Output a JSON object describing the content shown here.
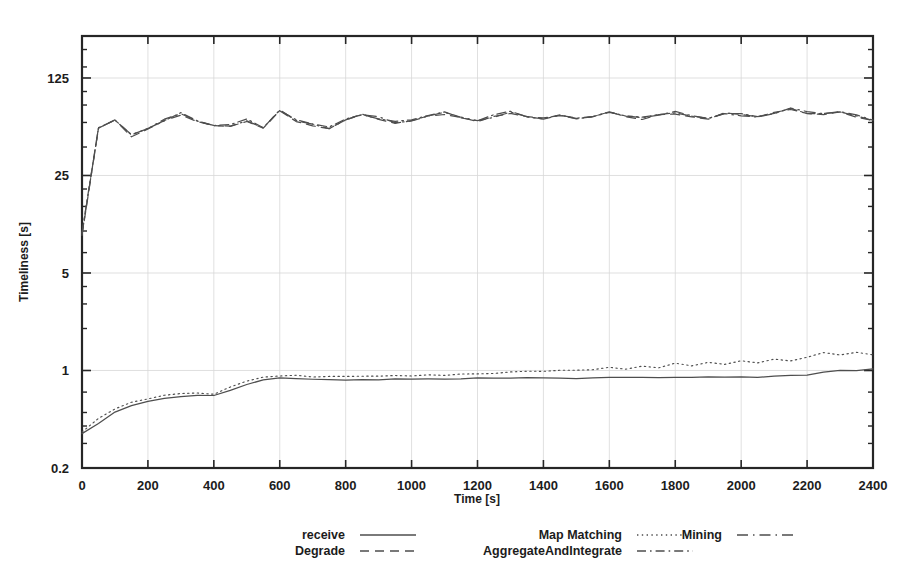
{
  "chart_data": {
    "type": "line",
    "title": "",
    "xlabel": "Time [s]",
    "ylabel": "Timeliness [s]",
    "yscale": "log",
    "xlim": [
      0,
      2400
    ],
    "ylim": [
      0.2,
      250
    ],
    "grid": true,
    "legend_position": "bottom",
    "xticks": [
      0,
      200,
      400,
      600,
      800,
      1000,
      1200,
      1400,
      1600,
      1800,
      2000,
      2200,
      2400
    ],
    "xtick_labels": [
      "0",
      "200",
      "400",
      "600",
      "800",
      "1000",
      "1200",
      "1400",
      "1600",
      "1800",
      "2000",
      "2200",
      "2400"
    ],
    "yticks": [
      0.2,
      1,
      5,
      25,
      125
    ],
    "ytick_labels": [
      "0.2",
      "1",
      "5",
      "25",
      "125"
    ],
    "x": [
      0,
      50,
      100,
      150,
      200,
      250,
      300,
      350,
      400,
      450,
      500,
      550,
      600,
      650,
      700,
      750,
      800,
      850,
      900,
      950,
      1000,
      1050,
      1100,
      1150,
      1200,
      1250,
      1300,
      1350,
      1400,
      1450,
      1500,
      1550,
      1600,
      1650,
      1700,
      1750,
      1800,
      1850,
      1900,
      1950,
      2000,
      2050,
      2100,
      2150,
      2200,
      2250,
      2300,
      2350,
      2400
    ],
    "series": [
      {
        "name": "receive",
        "style": "solid",
        "values": [
          0.35,
          0.42,
          0.5,
          0.56,
          0.6,
          0.63,
          0.65,
          0.66,
          0.66,
          0.72,
          0.8,
          0.86,
          0.88,
          0.88,
          0.87,
          0.86,
          0.86,
          0.86,
          0.86,
          0.87,
          0.87,
          0.87,
          0.87,
          0.87,
          0.88,
          0.88,
          0.88,
          0.88,
          0.88,
          0.88,
          0.88,
          0.89,
          0.89,
          0.89,
          0.89,
          0.89,
          0.9,
          0.9,
          0.9,
          0.9,
          0.9,
          0.9,
          0.91,
          0.92,
          0.93,
          0.98,
          1.0,
          1.0,
          1.02
        ]
      },
      {
        "name": "Map Matching",
        "style": "dotted",
        "values": [
          0.36,
          0.45,
          0.53,
          0.59,
          0.63,
          0.66,
          0.68,
          0.69,
          0.68,
          0.76,
          0.84,
          0.9,
          0.92,
          0.92,
          0.9,
          0.9,
          0.9,
          0.91,
          0.91,
          0.92,
          0.92,
          0.93,
          0.93,
          0.94,
          0.95,
          0.96,
          0.97,
          0.98,
          0.99,
          1.0,
          1.0,
          1.02,
          1.05,
          1.02,
          1.08,
          1.05,
          1.12,
          1.08,
          1.15,
          1.1,
          1.18,
          1.14,
          1.2,
          1.17,
          1.25,
          1.35,
          1.3,
          1.34,
          1.3
        ]
      },
      {
        "name": "Degrade",
        "style": "dashed",
        "values": [
          9.5,
          55,
          62,
          48,
          53,
          62,
          68,
          60,
          57,
          56,
          62,
          55,
          72,
          62,
          58,
          54,
          62,
          68,
          64,
          60,
          62,
          66,
          70,
          64,
          62,
          66,
          70,
          66,
          64,
          68,
          64,
          66,
          70,
          66,
          64,
          68,
          70,
          66,
          64,
          70,
          68,
          66,
          70,
          74,
          70,
          68,
          72,
          66,
          62
        ]
      },
      {
        "name": "AggregateAndIntegrate",
        "style": "dashdot",
        "values": [
          9.8,
          56,
          63,
          49,
          54,
          63,
          69,
          61,
          58,
          57,
          63,
          56,
          73,
          63,
          59,
          55,
          63,
          69,
          65,
          61,
          63,
          67,
          71,
          65,
          63,
          67,
          71,
          67,
          65,
          69,
          65,
          67,
          71,
          67,
          65,
          69,
          71,
          67,
          65,
          71,
          69,
          67,
          71,
          75,
          71,
          69,
          73,
          67,
          63
        ]
      },
      {
        "name": "Mining",
        "style": "longdash",
        "values": [
          9.6,
          55.5,
          62.5,
          48.5,
          53.5,
          62.5,
          68.5,
          60.5,
          57.5,
          56.5,
          62.5,
          55.5,
          72.5,
          62.5,
          58.5,
          54.5,
          62.5,
          68.5,
          64.5,
          60.5,
          62.5,
          66.5,
          70.5,
          64.5,
          62.5,
          66.5,
          70.5,
          66.5,
          64.5,
          68.5,
          64.5,
          66.5,
          70.5,
          66.5,
          64.5,
          68.5,
          70.5,
          66.5,
          64.5,
          70.5,
          68.5,
          66.5,
          70.5,
          74.5,
          70.5,
          68.5,
          72.5,
          66.5,
          62.5
        ]
      }
    ],
    "legend": [
      {
        "label": "receive",
        "style": "solid"
      },
      {
        "label": "Map Matching",
        "style": "dotted"
      },
      {
        "label": "Mining",
        "style": "longdash"
      },
      {
        "label": "Degrade",
        "style": "dashed"
      },
      {
        "label": "AggregateAndIntegrate",
        "style": "dashdot"
      }
    ]
  }
}
